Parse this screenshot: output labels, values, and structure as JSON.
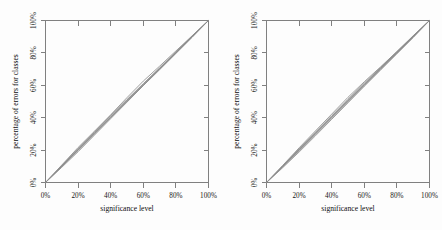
{
  "figure": {
    "background_color": "#fdfdfd",
    "axis_color": "#808080",
    "line_color": "#8c8c8c",
    "reference_line_color": "#6f6f6f",
    "panel_count": 2
  },
  "chart_data": [
    {
      "type": "line",
      "panel": "left",
      "title": "",
      "xlabel": "significance level",
      "ylabel": "percentage of errors for classes",
      "xlim": [
        0,
        100
      ],
      "ylim": [
        0,
        100
      ],
      "xticks": [
        0,
        20,
        40,
        60,
        80,
        100
      ],
      "yticks": [
        0,
        20,
        40,
        60,
        80,
        100
      ],
      "xticklabels": [
        "0%",
        "20%",
        "40%",
        "60%",
        "80%",
        "100%"
      ],
      "yticklabels": [
        "0%",
        "20%",
        "40%",
        "60%",
        "80%",
        "100%"
      ],
      "grid": false,
      "legend": null,
      "x": [
        0,
        10,
        20,
        30,
        40,
        50,
        60,
        70,
        80,
        90,
        100
      ],
      "series": [
        {
          "name": "reference-diagonal",
          "values": [
            0,
            10,
            20,
            30,
            40,
            50,
            60,
            70,
            80,
            90,
            100
          ]
        },
        {
          "name": "class-1",
          "values": [
            0,
            10.8,
            21.6,
            31.6,
            41.8,
            52.4,
            62.6,
            71.8,
            81.2,
            90.6,
            100
          ]
        },
        {
          "name": "class-2",
          "values": [
            0,
            9.4,
            19.0,
            29.2,
            39.4,
            49.6,
            59.8,
            69.6,
            79.6,
            89.6,
            100
          ]
        },
        {
          "name": "class-3",
          "values": [
            0,
            10.2,
            20.6,
            30.8,
            41.0,
            51.2,
            61.0,
            70.8,
            80.6,
            90.4,
            100
          ]
        },
        {
          "name": "class-4",
          "values": [
            0,
            9.8,
            19.8,
            30.0,
            40.2,
            50.4,
            60.2,
            70.2,
            80.2,
            90.2,
            100
          ]
        },
        {
          "name": "class-5",
          "values": [
            0,
            10.5,
            21.0,
            31.2,
            41.4,
            51.0,
            60.6,
            70.4,
            80.0,
            90.0,
            100
          ]
        }
      ]
    },
    {
      "type": "line",
      "panel": "right",
      "title": "",
      "xlabel": "significance level",
      "ylabel": "percentage of errors for classes",
      "xlim": [
        0,
        100
      ],
      "ylim": [
        0,
        100
      ],
      "xticks": [
        0,
        20,
        40,
        60,
        80,
        100
      ],
      "yticks": [
        0,
        20,
        40,
        60,
        80,
        100
      ],
      "xticklabels": [
        "0%",
        "20%",
        "40%",
        "60%",
        "80%",
        "100%"
      ],
      "yticklabels": [
        "0%",
        "20%",
        "40%",
        "60%",
        "80%",
        "100%"
      ],
      "grid": false,
      "legend": null,
      "x": [
        0,
        10,
        20,
        30,
        40,
        50,
        60,
        70,
        80,
        90,
        100
      ],
      "series": [
        {
          "name": "reference-diagonal",
          "values": [
            0,
            10,
            20,
            30,
            40,
            50,
            60,
            70,
            80,
            90,
            100
          ]
        },
        {
          "name": "class-1",
          "values": [
            0,
            10.6,
            21.4,
            31.8,
            42.2,
            52.6,
            62.2,
            71.4,
            80.8,
            90.4,
            100
          ]
        },
        {
          "name": "class-2",
          "values": [
            0,
            9.2,
            18.8,
            28.8,
            39.0,
            49.2,
            59.4,
            69.4,
            79.4,
            89.4,
            100
          ]
        },
        {
          "name": "class-3",
          "values": [
            0,
            10.0,
            20.4,
            30.6,
            40.8,
            51.4,
            61.4,
            71.0,
            80.8,
            90.6,
            100
          ]
        },
        {
          "name": "class-4",
          "values": [
            0,
            9.6,
            19.6,
            29.8,
            40.0,
            50.2,
            60.4,
            70.4,
            80.4,
            90.2,
            100
          ]
        },
        {
          "name": "class-5",
          "values": [
            0,
            10.4,
            20.8,
            31.0,
            41.2,
            50.8,
            60.8,
            70.6,
            80.2,
            90.0,
            100
          ]
        }
      ]
    }
  ],
  "panels": [
    {
      "id": "left",
      "xlabel": "significance level",
      "ylabel": "percentage of errors for classes",
      "xticklabels": [
        "0%",
        "20%",
        "40%",
        "60%",
        "80%",
        "100%"
      ],
      "yticklabels": [
        "0%",
        "20%",
        "40%",
        "60%",
        "80%",
        "100%"
      ]
    },
    {
      "id": "right",
      "xlabel": "significance level",
      "ylabel": "percentage of errors for classes",
      "xticklabels": [
        "0%",
        "20%",
        "40%",
        "60%",
        "80%",
        "100%"
      ],
      "yticklabels": [
        "0%",
        "20%",
        "40%",
        "60%",
        "80%",
        "100%"
      ]
    }
  ]
}
